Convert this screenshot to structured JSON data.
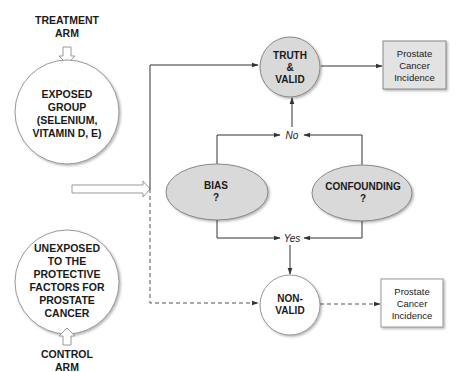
{
  "diagram": {
    "colors": {
      "line": "#333333",
      "shaded_fill": "#d9d9d9",
      "white_fill": "#ffffff",
      "box_fill": "#e3e3e3",
      "outline": "#888888"
    },
    "treatment_arm": {
      "line1": "TREATMENT",
      "line2": "ARM"
    },
    "exposed_group": {
      "lines": [
        "EXPOSED",
        "GROUP",
        "(SELENIUM,",
        "VITAMIN D, E)"
      ]
    },
    "unexposed_group": {
      "lines": [
        "UNEXPOSED",
        "TO THE",
        "PROTECTIVE",
        "FACTORS FOR",
        "PROSTATE",
        "CANCER"
      ]
    },
    "control_arm": {
      "line1": "CONTROL",
      "line2": "ARM"
    },
    "truth_valid": {
      "lines": [
        "TRUTH",
        "&",
        "VALID"
      ]
    },
    "bias": {
      "lines": [
        "BIAS",
        "?"
      ]
    },
    "confounding": {
      "lines": [
        "CONFOUNDING",
        "?"
      ]
    },
    "no_label": "No",
    "yes_label": "Yes",
    "non_valid": {
      "lines": [
        "NON-",
        "VALID"
      ]
    },
    "outcome_valid": {
      "lines": [
        "Prostate",
        "Cancer",
        "Incidence"
      ]
    },
    "outcome_nonvalid": {
      "lines": [
        "Prostate",
        "Cancer",
        "Incidence"
      ]
    }
  }
}
